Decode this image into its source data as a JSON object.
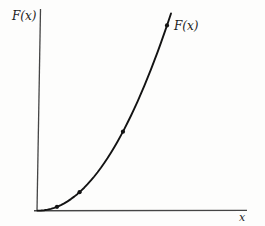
{
  "figure": {
    "background": "#fdfdfc",
    "axis_color": "#454545",
    "curve_color": "#131313",
    "labels": {
      "y_axis": "F(x)",
      "curve": "F(x)",
      "x_axis": "x"
    }
  },
  "chart_data": {
    "type": "line",
    "title": "",
    "xlabel": "x",
    "ylabel": "F(x)",
    "legend_position": "none",
    "grid": false,
    "axes_numeric": false,
    "x_range": [
      0,
      1
    ],
    "y_range": [
      0,
      1
    ],
    "curve_points": [
      [
        0,
        0
      ],
      [
        0.025,
        0.0005
      ],
      [
        0.05,
        0.0021
      ],
      [
        0.075,
        0.0049
      ],
      [
        0.1,
        0.0089
      ],
      [
        0.125,
        0.0141
      ],
      [
        0.15,
        0.0205
      ],
      [
        0.175,
        0.0281
      ],
      [
        0.2,
        0.0369
      ],
      [
        0.225,
        0.047
      ],
      [
        0.25,
        0.0583
      ],
      [
        0.275,
        0.0709
      ],
      [
        0.3,
        0.0847
      ],
      [
        0.325,
        0.0998
      ],
      [
        0.35,
        0.1162
      ],
      [
        0.375,
        0.1339
      ],
      [
        0.4,
        0.1528
      ],
      [
        0.425,
        0.173
      ],
      [
        0.45,
        0.1945
      ],
      [
        0.475,
        0.2173
      ],
      [
        0.5,
        0.2415
      ],
      [
        0.525,
        0.2668
      ],
      [
        0.55,
        0.2936
      ],
      [
        0.575,
        0.3216
      ],
      [
        0.6,
        0.351
      ],
      [
        0.625,
        0.3816
      ],
      [
        0.65,
        0.4135
      ],
      [
        0.675,
        0.4468
      ],
      [
        0.7,
        0.4814
      ],
      [
        0.725,
        0.5172
      ],
      [
        0.75,
        0.5545
      ],
      [
        0.775,
        0.593
      ],
      [
        0.8,
        0.6329
      ],
      [
        0.825,
        0.6741
      ],
      [
        0.85,
        0.7167
      ],
      [
        0.875,
        0.7606
      ],
      [
        0.9,
        0.8057
      ],
      [
        0.925,
        0.8523
      ],
      [
        0.95,
        0.9002
      ],
      [
        0.975,
        0.9494
      ],
      [
        1,
        1
      ]
    ],
    "marked_points": [
      [
        0.146,
        0.0194
      ],
      [
        0.315,
        0.0936
      ],
      [
        0.64,
        0.4005
      ],
      [
        0.97,
        0.9395
      ]
    ]
  }
}
